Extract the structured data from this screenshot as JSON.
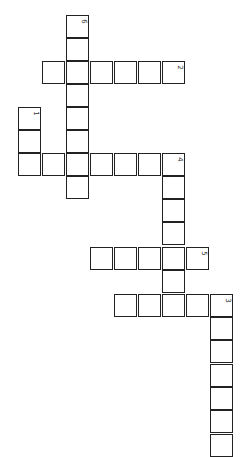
{
  "puzzle": {
    "type": "crossword",
    "orientation": "rotated-90",
    "cell_size": 23,
    "words": [
      {
        "number": "1",
        "direction": "vertical",
        "cells": [
          [
            18,
            107
          ],
          [
            18,
            130
          ],
          [
            18,
            153
          ]
        ]
      },
      {
        "number": "2",
        "direction": "horizontal",
        "cells": [
          [
            162,
            61
          ],
          [
            138,
            61
          ],
          [
            114,
            61
          ],
          [
            90,
            61
          ],
          [
            66,
            61
          ],
          [
            42,
            61
          ]
        ]
      },
      {
        "number": "3",
        "direction": "vertical",
        "cells": [
          [
            210,
            294
          ],
          [
            210,
            317
          ],
          [
            210,
            340
          ],
          [
            210,
            364
          ],
          [
            210,
            387
          ],
          [
            210,
            410
          ],
          [
            210,
            434
          ]
        ]
      },
      {
        "number": "4",
        "direction": "horizontal",
        "cells": [
          [
            162,
            153
          ],
          [
            138,
            153
          ],
          [
            114,
            153
          ],
          [
            90,
            153
          ],
          [
            66,
            153
          ],
          [
            42,
            153
          ],
          [
            18,
            153
          ]
        ]
      },
      {
        "number": "4",
        "direction": "vertical",
        "cells": [
          [
            162,
            176
          ],
          [
            162,
            199
          ],
          [
            162,
            222
          ],
          [
            162,
            247
          ],
          [
            162,
            270
          ],
          [
            162,
            294
          ]
        ]
      },
      {
        "number": "5",
        "direction": "horizontal",
        "cells": [
          [
            186,
            247
          ],
          [
            162,
            247
          ],
          [
            138,
            247
          ],
          [
            114,
            247
          ],
          [
            90,
            247
          ]
        ]
      },
      {
        "number": "3",
        "direction": "horizontal",
        "cells": [
          [
            186,
            294
          ],
          [
            162,
            294
          ],
          [
            138,
            294
          ],
          [
            114,
            294
          ]
        ]
      },
      {
        "number": "6",
        "direction": "vertical",
        "cells": [
          [
            66,
            15
          ],
          [
            66,
            38
          ],
          [
            66,
            61
          ],
          [
            66,
            84
          ],
          [
            66,
            107
          ],
          [
            66,
            130
          ],
          [
            66,
            153
          ],
          [
            66,
            176
          ]
        ]
      }
    ],
    "numbered_cells": [
      {
        "label": "6",
        "x": 66,
        "y": 15
      },
      {
        "label": "2",
        "x": 162,
        "y": 61
      },
      {
        "label": "1",
        "x": 18,
        "y": 107
      },
      {
        "label": "4",
        "x": 162,
        "y": 153
      },
      {
        "label": "5",
        "x": 186,
        "y": 247
      },
      {
        "label": "3",
        "x": 210,
        "y": 294
      }
    ]
  }
}
